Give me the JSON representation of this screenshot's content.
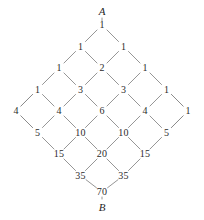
{
  "figure": {
    "type": "lattice-path-diagram",
    "start_label": "A",
    "end_label": "B",
    "edge_color": "#8a8a8a",
    "text_color": "#2b2b2b",
    "background_color": "#ffffff",
    "geometry": {
      "center_x": 102,
      "top_y": 25,
      "row_pitch_y": 21.5,
      "col_pitch_x": 43
    },
    "rows": [
      {
        "index": 0,
        "y": 25,
        "values": [
          "1"
        ],
        "xs": [
          102
        ]
      },
      {
        "index": 1,
        "y": 46.5,
        "values": [
          "1",
          "1"
        ],
        "xs": [
          80.5,
          123.5
        ]
      },
      {
        "index": 2,
        "y": 68,
        "values": [
          "1",
          "2",
          "1"
        ],
        "xs": [
          59,
          102,
          145
        ]
      },
      {
        "index": 3,
        "y": 89.5,
        "values": [
          "1",
          "3",
          "3",
          "1"
        ],
        "xs": [
          37.5,
          80.5,
          123.5,
          166.5
        ]
      },
      {
        "index": 4,
        "y": 111,
        "values": [
          "4",
          "4",
          "6",
          "4",
          "1"
        ],
        "xs": [
          16,
          59,
          102,
          145,
          188
        ]
      },
      {
        "index": 5,
        "y": 132.5,
        "values": [
          "5",
          "10",
          "10",
          "5"
        ],
        "xs": [
          37.5,
          80.5,
          123.5,
          166.5
        ]
      },
      {
        "index": 6,
        "y": 154,
        "values": [
          "15",
          "20",
          "15"
        ],
        "xs": [
          59,
          102,
          145
        ]
      },
      {
        "index": 7,
        "y": 175.5,
        "values": [
          "35",
          "35"
        ],
        "xs": [
          80.5,
          123.5
        ]
      },
      {
        "index": 8,
        "y": 192,
        "values": [
          "70"
        ],
        "xs": [
          102
        ]
      }
    ],
    "endpoints": [
      {
        "name": "A",
        "label": "A",
        "x": 102,
        "y": 11
      },
      {
        "name": "B",
        "label": "B",
        "x": 102,
        "y": 207
      }
    ]
  }
}
